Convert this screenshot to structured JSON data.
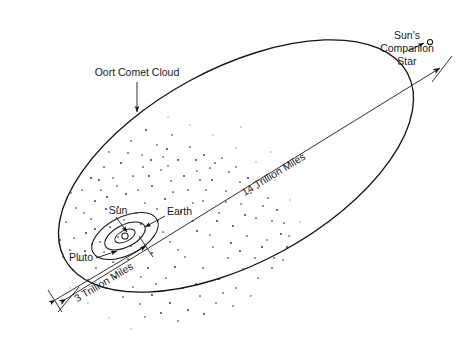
{
  "diagram": {
    "background_color": "#ffffff",
    "ink_color": "#151515",
    "labels": {
      "oort_cloud": "Oort Comet Cloud",
      "companion_star_line1": "Sun's",
      "companion_star_line2": "Companion",
      "companion_star_line3": "Star",
      "sun": "Sun",
      "earth": "Earth",
      "pluto": "Pluto",
      "long_axis_distance": "14 Trillion Miles",
      "short_axis_distance": "3 Trillion Miles"
    },
    "features": [
      {
        "name": "companion-star-orbit-ellipse",
        "kind": "ellipse"
      },
      {
        "name": "oort-comet-cloud",
        "kind": "stipple-annulus"
      },
      {
        "name": "pluto-orbit-ellipse",
        "kind": "ellipse"
      },
      {
        "name": "earth-orbit-ellipse",
        "kind": "ellipse"
      },
      {
        "name": "sun-marker",
        "kind": "circle"
      },
      {
        "name": "companion-star-marker",
        "kind": "circle"
      }
    ],
    "measurements": [
      {
        "name": "14-trillion-miles",
        "value": "14 Trillion Miles",
        "axis": "major"
      },
      {
        "name": "3-trillion-miles",
        "value": "3 Trillion Miles",
        "axis": "inner"
      }
    ]
  }
}
